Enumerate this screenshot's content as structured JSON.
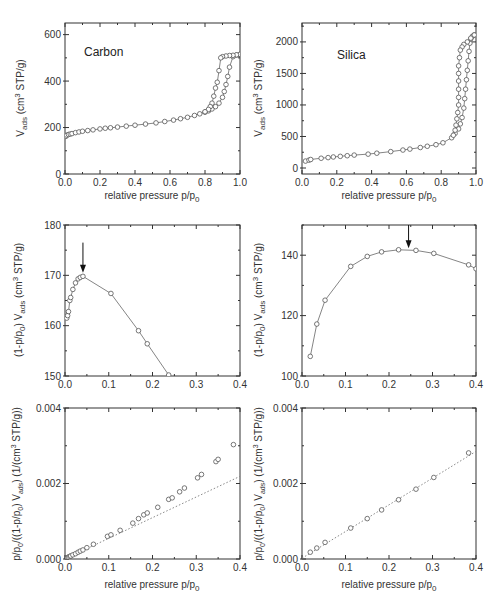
{
  "chart_data": [
    {
      "id": "carbon-isotherm",
      "type": "line",
      "title": "Carbon",
      "xlabel": "relative pressure p/p0",
      "ylabel": "Vads (cm3 STP/g)",
      "xlim": [
        0,
        1.0
      ],
      "ylim": [
        0,
        650
      ],
      "xticks": [
        "0.0",
        "0.2",
        "0.4",
        "0.6",
        "0.8",
        "1.0"
      ],
      "xtick_values": [
        0,
        0.2,
        0.4,
        0.6,
        0.8,
        1.0
      ],
      "yticks": [
        "0",
        "200",
        "400",
        "600"
      ],
      "ytick_values": [
        0,
        200,
        400,
        600
      ],
      "marker": "open-circle",
      "series": [
        {
          "name": "adsorption",
          "x": [
            0.005,
            0.01,
            0.02,
            0.03,
            0.04,
            0.06,
            0.08,
            0.1,
            0.13,
            0.16,
            0.2,
            0.23,
            0.26,
            0.3,
            0.35,
            0.4,
            0.46,
            0.52,
            0.57,
            0.62,
            0.66,
            0.7,
            0.74,
            0.77,
            0.8,
            0.82,
            0.84,
            0.86,
            0.88,
            0.9,
            0.91,
            0.92,
            0.93,
            0.94,
            0.96,
            0.98,
            1.0
          ],
          "y": [
            162,
            167,
            170,
            172,
            174,
            178,
            181,
            184,
            187,
            190,
            194,
            197,
            199,
            202,
            206,
            210,
            215,
            220,
            226,
            232,
            238,
            244,
            252,
            259,
            266,
            272,
            280,
            290,
            305,
            330,
            355,
            385,
            420,
            460,
            505,
            512,
            515
          ]
        },
        {
          "name": "desorption",
          "x": [
            1.0,
            0.98,
            0.96,
            0.94,
            0.92,
            0.9,
            0.89,
            0.88,
            0.87,
            0.86,
            0.85,
            0.84,
            0.83,
            0.82,
            0.8
          ],
          "y": [
            515,
            513,
            511,
            510,
            508,
            505,
            500,
            445,
            395,
            370,
            335,
            305,
            290,
            278,
            268
          ]
        }
      ]
    },
    {
      "id": "silica-isotherm",
      "type": "line",
      "title": "Silica",
      "xlabel": "relative pressure p/p0",
      "ylabel": "Vads (cm3 STP/g)",
      "xlim": [
        0,
        1.0
      ],
      "ylim": [
        -95,
        2300
      ],
      "xticks": [
        "0.0",
        "0.2",
        "0.4",
        "0.6",
        "0.8",
        "1.0"
      ],
      "xtick_values": [
        0,
        0.2,
        0.4,
        0.6,
        0.8,
        1.0
      ],
      "yticks": [
        "0",
        "500",
        "1000",
        "1500",
        "2000"
      ],
      "ytick_values": [
        0,
        500,
        1000,
        1500,
        2000
      ],
      "marker": "open-circle",
      "series": [
        {
          "name": "adsorption",
          "x": [
            0.02,
            0.04,
            0.05,
            0.11,
            0.15,
            0.18,
            0.22,
            0.26,
            0.3,
            0.38,
            0.43,
            0.51,
            0.58,
            0.62,
            0.68,
            0.72,
            0.77,
            0.81,
            0.86,
            0.88,
            0.9,
            0.91,
            0.92,
            0.93,
            0.935,
            0.94,
            0.945,
            0.95,
            0.955,
            0.96,
            0.965,
            0.97,
            0.98,
            0.99
          ],
          "y": [
            110,
            125,
            135,
            155,
            165,
            175,
            185,
            195,
            205,
            220,
            235,
            260,
            285,
            300,
            325,
            345,
            370,
            400,
            480,
            550,
            620,
            700,
            800,
            950,
            1100,
            1250,
            1400,
            1550,
            1700,
            1850,
            1980,
            2050,
            2090,
            2110
          ]
        },
        {
          "name": "desorption",
          "x": [
            0.99,
            0.97,
            0.95,
            0.93,
            0.92,
            0.91,
            0.905,
            0.9,
            0.9,
            0.9,
            0.9,
            0.9,
            0.9,
            0.895,
            0.89,
            0.885,
            0.88,
            0.87
          ],
          "y": [
            2110,
            2060,
            2000,
            1960,
            1920,
            1870,
            1750,
            1620,
            1500,
            1380,
            1250,
            1120,
            1000,
            880,
            780,
            680,
            600,
            520
          ]
        }
      ]
    },
    {
      "id": "carbon-rouquerol",
      "type": "line",
      "title": "",
      "xlabel": "",
      "ylabel": "(1-p/p0) Vads (cm3 STP/g)",
      "xlim": [
        0,
        0.4
      ],
      "ylim": [
        150,
        180
      ],
      "xticks": [
        "0.0",
        "0.1",
        "0.2",
        "0.3",
        "0.4"
      ],
      "xtick_values": [
        0,
        0.1,
        0.2,
        0.3,
        0.4
      ],
      "yticks": [
        "150",
        "160",
        "170",
        "180"
      ],
      "ytick_values": [
        150,
        160,
        170,
        180
      ],
      "marker": "open-circle",
      "annotation": {
        "type": "arrow",
        "x": 0.041,
        "y_from": 176.5,
        "y_to": 170.5
      },
      "series": [
        {
          "name": "Carbon",
          "x": [
            0.004,
            0.006,
            0.008,
            0.011,
            0.013,
            0.018,
            0.024,
            0.03,
            0.035,
            0.041,
            0.105,
            0.168,
            0.188,
            0.237
          ],
          "y": [
            161.5,
            162.0,
            162.8,
            165.0,
            165.6,
            167.2,
            168.5,
            169.3,
            169.6,
            169.8,
            166.4,
            159.0,
            156.4,
            150.2
          ]
        }
      ]
    },
    {
      "id": "silica-rouquerol",
      "type": "line",
      "title": "",
      "xlabel": "",
      "ylabel": "(1-p/p0) Vads (cm3 STP/g)",
      "xlim": [
        0,
        0.4
      ],
      "ylim": [
        100,
        150
      ],
      "xticks": [
        "0.0",
        "0.1",
        "0.2",
        "0.3",
        "0.4"
      ],
      "xtick_values": [
        0,
        0.1,
        0.2,
        0.3,
        0.4
      ],
      "yticks": [
        "100",
        "120",
        "140"
      ],
      "ytick_values": [
        100,
        120,
        140
      ],
      "marker": "open-circle",
      "annotation": {
        "type": "arrow",
        "x": 0.245,
        "y_from": 150,
        "y_to": 142.3
      },
      "series": [
        {
          "name": "Silica",
          "x": [
            0.019,
            0.034,
            0.053,
            0.112,
            0.15,
            0.183,
            0.222,
            0.262,
            0.303,
            0.383,
            0.4
          ],
          "y": [
            106.5,
            117.2,
            125.1,
            136.3,
            139.6,
            141.1,
            141.8,
            141.6,
            140.6,
            136.8,
            135.5
          ]
        }
      ]
    },
    {
      "id": "carbon-bet",
      "type": "scatter",
      "title": "",
      "xlabel": "relative pressure p/p0",
      "ylabel": "p/p0/((1-p/p0) Vads) (1/(cm3 STP/g))",
      "xlim": [
        0,
        0.4
      ],
      "ylim": [
        0,
        0.004
      ],
      "xticks": [
        "0.0",
        "0.1",
        "0.2",
        "0.3",
        "0.4"
      ],
      "xtick_values": [
        0,
        0.1,
        0.2,
        0.3,
        0.4
      ],
      "yticks": [
        "0.000",
        "0.002",
        "0.004"
      ],
      "ytick_values": [
        0,
        0.002,
        0.004
      ],
      "marker": "open-circle",
      "fit_line": {
        "x": [
          0,
          0.4
        ],
        "y": [
          0.0,
          0.00219
        ],
        "style": "dotted"
      },
      "series": [
        {
          "name": "Carbon",
          "x": [
            0.004,
            0.006,
            0.008,
            0.011,
            0.013,
            0.018,
            0.024,
            0.03,
            0.035,
            0.041,
            0.05,
            0.065,
            0.097,
            0.105,
            0.126,
            0.155,
            0.168,
            0.18,
            0.188,
            0.212,
            0.237,
            0.245,
            0.262,
            0.273,
            0.303,
            0.312,
            0.345,
            0.35,
            0.385
          ],
          "y": [
            2e-05,
            4e-05,
            5e-05,
            7e-05,
            8e-05,
            0.00011,
            0.00014,
            0.00018,
            0.00021,
            0.00024,
            0.0003,
            0.00039,
            0.0006,
            0.00064,
            0.00076,
            0.00095,
            0.00107,
            0.00117,
            0.00122,
            0.00137,
            0.00158,
            0.00162,
            0.00178,
            0.00188,
            0.00215,
            0.00224,
            0.00258,
            0.00264,
            0.00303
          ]
        }
      ]
    },
    {
      "id": "silica-bet",
      "type": "scatter",
      "title": "",
      "xlabel": "relative pressure p/p0",
      "ylabel": "p/p0/((1-p/p0) Vads) (1/(cm3 STP/g))",
      "xlim": [
        0,
        0.4
      ],
      "ylim": [
        0,
        0.004
      ],
      "xticks": [
        "0.0",
        "0.1",
        "0.2",
        "0.3",
        "0.4"
      ],
      "xtick_values": [
        0,
        0.1,
        0.2,
        0.3,
        0.4
      ],
      "yticks": [
        "0.000",
        "0.002",
        "0.004"
      ],
      "ytick_values": [
        0,
        0.002,
        0.004
      ],
      "marker": "open-circle",
      "fit_line": {
        "x": [
          0,
          0.4
        ],
        "y": [
          2e-05,
          0.00285
        ],
        "style": "dotted"
      },
      "series": [
        {
          "name": "Silica",
          "x": [
            0.019,
            0.034,
            0.053,
            0.112,
            0.15,
            0.183,
            0.222,
            0.262,
            0.303,
            0.383
          ],
          "y": [
            0.00018,
            0.00029,
            0.00044,
            0.00082,
            0.00107,
            0.0013,
            0.00157,
            0.00185,
            0.00216,
            0.00281
          ]
        }
      ]
    }
  ],
  "labels": {
    "carbon_title": "Carbon",
    "silica_title": "Silica",
    "xlabel_main": "relative pressure p/p",
    "xlabel_sub": "0",
    "ylabel_iso_main": "V",
    "ylabel_iso_sub": "ads",
    "ylabel_iso_rest": " (cm",
    "ylabel_iso_sup": "3",
    "ylabel_iso_end": " STP/g)",
    "ylabel_rq_pre": "(1-p/p",
    "ylabel_rq_sub0": "0",
    "ylabel_rq_mid": ") V",
    "ylabel_rq_subads": "ads",
    "ylabel_rq_rest": " (cm",
    "ylabel_rq_sup": "3",
    "ylabel_rq_end": " STP/g)",
    "ylabel_bet_a": "p/p",
    "ylabel_bet_sub0": "0",
    "ylabel_bet_b": "/((1-p/p",
    "ylabel_bet_sub0b": "0",
    "ylabel_bet_c": ") V",
    "ylabel_bet_subads": "ads",
    "ylabel_bet_d": ") (1/(cm",
    "ylabel_bet_sup": "3",
    "ylabel_bet_e": " STP/g))"
  },
  "colors": {
    "axis": "#333333",
    "line": "#666666",
    "marker": "#555555",
    "fit": "#888888"
  }
}
